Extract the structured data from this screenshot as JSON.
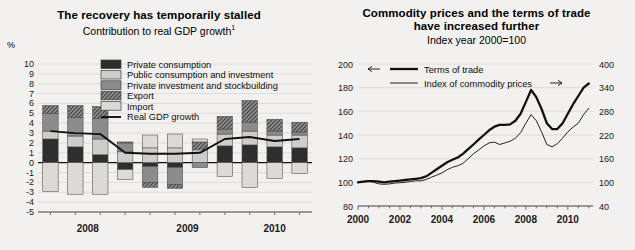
{
  "left": {
    "title": "The recovery has temporarily stalled",
    "subtitle": "Contribution to real GDP growth",
    "subtitle_footnote": "1",
    "unit_label": "%",
    "legend": [
      {
        "label": "Private consumption",
        "swatch": "dark-fill-swatch"
      },
      {
        "label": "Public consumption and investment",
        "swatch": "light-fill-swatch"
      },
      {
        "label": "Private investment and stockbuilding",
        "swatch": "medium-fill-swatch"
      },
      {
        "label": "Export",
        "swatch": "hatched-fill-swatch"
      },
      {
        "label": "Import",
        "swatch": "pale-fill-swatch"
      },
      {
        "label": "Real GDP growth",
        "swatch": "line-swatch"
      }
    ],
    "chart_data": {
      "type": "bar",
      "title": "The recovery has temporarily stalled",
      "subtitle": "Contribution to real GDP growth 1",
      "xlabel": "",
      "ylabel": "%",
      "ylim": [
        -5,
        10
      ],
      "yticks": [
        10,
        9,
        8,
        7,
        6,
        5,
        4,
        3,
        2,
        1,
        0,
        -1,
        -2,
        -3,
        -4,
        -5
      ],
      "grid": true,
      "legend_position": "top-center",
      "x_group_labels": [
        "2008",
        "2009",
        "2010"
      ],
      "categories": [
        "2008Q1",
        "2008Q2",
        "2008Q3",
        "2008Q4",
        "2009Q1",
        "2009Q2",
        "2009Q3",
        "2009Q4",
        "2010Q1",
        "2010Q2",
        "2010Q3"
      ],
      "series": [
        {
          "name": "Private consumption",
          "values": [
            2.4,
            1.6,
            0.8,
            -0.7,
            -0.4,
            -0.5,
            0.0,
            1.7,
            1.8,
            1.6,
            1.5
          ]
        },
        {
          "name": "Public consumption and investment",
          "values": [
            0.8,
            1.1,
            1.6,
            1.1,
            1.5,
            1.5,
            1.3,
            1.2,
            1.4,
            1.2,
            1.3
          ]
        },
        {
          "name": "Private investment and stockbuilding",
          "values": [
            1.8,
            1.9,
            2.1,
            0.9,
            -1.6,
            -1.7,
            -0.5,
            0.5,
            0.9,
            0.4,
            0.3
          ]
        },
        {
          "name": "Export",
          "values": [
            0.8,
            1.2,
            1.2,
            0.1,
            -0.5,
            -0.4,
            0.8,
            1.3,
            2.2,
            1.2,
            1.0
          ]
        },
        {
          "name": "Import",
          "values": [
            -2.9,
            -3.2,
            -3.2,
            -1.0,
            1.3,
            1.4,
            0.3,
            -1.4,
            -2.5,
            -1.6,
            -1.1
          ]
        }
      ],
      "line_series": {
        "name": "Real GDP growth",
        "values": [
          3.2,
          3.0,
          2.9,
          1.0,
          0.9,
          0.9,
          1.0,
          2.4,
          2.6,
          2.2,
          2.4
        ]
      }
    }
  },
  "right": {
    "title_line1": "Commodity prices and the terms of trade",
    "title_line2": "have increased further",
    "subtitle": "Index year 2000=100",
    "legend": [
      {
        "label": "Terms of trade",
        "arrow": "left-arrow",
        "style": "thick-line"
      },
      {
        "label": "Index of commodity prices",
        "arrow": "right-arrow",
        "style": "thin-line"
      }
    ],
    "chart_data": {
      "type": "line",
      "title": "Commodity prices and the terms of trade have increased further",
      "subtitle": "Index year 2000=100",
      "xlabel": "",
      "ylabel_left": "Terms of trade index",
      "ylabel_right": "Index of commodity prices",
      "ylim_left": [
        80,
        200
      ],
      "ylim_right": [
        40,
        400
      ],
      "yticks_left": [
        200,
        180,
        160,
        140,
        120,
        100,
        80
      ],
      "yticks_right": [
        400,
        340,
        280,
        220,
        160,
        100,
        40
      ],
      "xticks": [
        "2000",
        "2002",
        "2004",
        "2006",
        "2008",
        "2010"
      ],
      "xlim": [
        2000,
        2011.2
      ],
      "grid": true,
      "legend_position": "top-left",
      "series": [
        {
          "name": "Terms of trade",
          "axis": "left",
          "x": [
            2000.0,
            2000.25,
            2000.5,
            2000.75,
            2001.0,
            2001.25,
            2001.5,
            2001.75,
            2002.0,
            2002.25,
            2002.5,
            2002.75,
            2003.0,
            2003.25,
            2003.5,
            2003.75,
            2004.0,
            2004.25,
            2004.5,
            2004.75,
            2005.0,
            2005.25,
            2005.5,
            2005.75,
            2006.0,
            2006.25,
            2006.5,
            2006.75,
            2007.0,
            2007.25,
            2007.5,
            2007.75,
            2008.0,
            2008.25,
            2008.5,
            2008.75,
            2009.0,
            2009.25,
            2009.5,
            2009.75,
            2010.0,
            2010.25,
            2010.5,
            2010.75,
            2011.0
          ],
          "values": [
            100,
            100.5,
            101,
            101,
            100.5,
            100,
            100.5,
            101,
            101.5,
            102,
            102.5,
            103,
            103.5,
            105,
            108,
            111,
            114,
            117,
            119,
            121,
            124,
            128,
            132,
            136,
            140,
            144,
            147,
            148.5,
            148.5,
            149,
            152,
            158,
            168,
            178,
            172,
            162,
            150,
            145,
            145,
            150,
            158,
            166,
            173,
            180,
            183.5
          ]
        },
        {
          "name": "Index of commodity prices",
          "axis": "right",
          "x": [
            2000.0,
            2000.25,
            2000.5,
            2000.75,
            2001.0,
            2001.25,
            2001.5,
            2001.75,
            2002.0,
            2002.25,
            2002.5,
            2002.75,
            2003.0,
            2003.25,
            2003.5,
            2003.75,
            2004.0,
            2004.25,
            2004.5,
            2004.75,
            2005.0,
            2005.25,
            2005.5,
            2005.75,
            2006.0,
            2006.25,
            2006.5,
            2006.75,
            2007.0,
            2007.25,
            2007.5,
            2007.75,
            2008.0,
            2008.25,
            2008.5,
            2008.75,
            2009.0,
            2009.25,
            2009.5,
            2009.75,
            2010.0,
            2010.25,
            2010.5,
            2010.75,
            2011.0
          ],
          "values": [
            100,
            101,
            103,
            100,
            96,
            95,
            96,
            98,
            99,
            100,
            102,
            104,
            104,
            107,
            113,
            118,
            124,
            132,
            138,
            142,
            148,
            160,
            172,
            182,
            192,
            200,
            202,
            196,
            200,
            204,
            212,
            226,
            250,
            272,
            256,
            228,
            196,
            190,
            198,
            212,
            228,
            240,
            250,
            272,
            288
          ]
        }
      ]
    }
  }
}
